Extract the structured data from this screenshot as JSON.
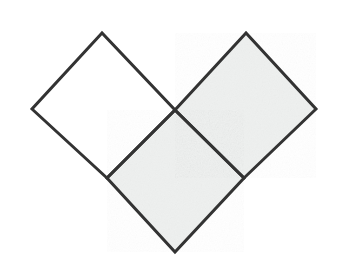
{
  "canvas": {
    "width": 343,
    "height": 263,
    "background_color": "#ffffff",
    "title": "Three rotated squares forming a V shape"
  },
  "style": {
    "stroke_color": "#333333",
    "stroke_width": 3,
    "shaded_fill_color": "#eef0ef",
    "empty_fill_color": "#ffffff",
    "line_join": "miter"
  },
  "figure": {
    "type": "geometric-diagram",
    "shape_count": 3,
    "shapes": [
      {
        "id": "left-diamond",
        "label": "left diamond",
        "fill": "#ffffff",
        "shaded": false,
        "points": "102,33 32,109 107,178 175,110",
        "vertices": [
          {
            "name": "top",
            "x": 102,
            "y": 33
          },
          {
            "name": "left",
            "x": 32,
            "y": 109
          },
          {
            "name": "bottom",
            "x": 107,
            "y": 178
          },
          {
            "name": "right",
            "x": 175,
            "y": 110
          }
        ]
      },
      {
        "id": "right-diamond",
        "label": "right diamond",
        "fill": "#eef0ef",
        "shaded": true,
        "points": "246,33 175,110 244,178 316,109",
        "vertices": [
          {
            "name": "top",
            "x": 246,
            "y": 33
          },
          {
            "name": "left",
            "x": 175,
            "y": 110
          },
          {
            "name": "bottom",
            "x": 244,
            "y": 178
          },
          {
            "name": "right",
            "x": 316,
            "y": 109
          }
        ]
      },
      {
        "id": "bottom-diamond",
        "label": "bottom diamond",
        "fill": "#eef0ef",
        "shaded": true,
        "points": "175,110 107,178 175,252 244,178",
        "vertices": [
          {
            "name": "top",
            "x": 175,
            "y": 110
          },
          {
            "name": "left",
            "x": 107,
            "y": 178
          },
          {
            "name": "bottom",
            "x": 175,
            "y": 252
          },
          {
            "name": "right",
            "x": 244,
            "y": 178
          }
        ]
      }
    ],
    "key_points": [
      {
        "name": "center-junction",
        "x": 175,
        "y": 110
      },
      {
        "name": "left-junction",
        "x": 107,
        "y": 178
      },
      {
        "name": "right-junction",
        "x": 244,
        "y": 178
      },
      {
        "name": "left-apex",
        "x": 102,
        "y": 33
      },
      {
        "name": "right-apex",
        "x": 246,
        "y": 33
      },
      {
        "name": "far-left",
        "x": 32,
        "y": 109
      },
      {
        "name": "far-right",
        "x": 316,
        "y": 109
      },
      {
        "name": "bottom-tip",
        "x": 175,
        "y": 252
      }
    ]
  }
}
